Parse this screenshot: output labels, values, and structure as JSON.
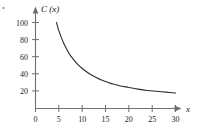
{
  "figure": {
    "corner_mark": "·",
    "background_color": "#ffffff",
    "axis_color": "#6f6f6f",
    "curve_color": "#2b2b2b",
    "label_color": "#222222"
  },
  "chart_data": {
    "type": "line",
    "title": "",
    "subtitle": "",
    "xlabel": "x",
    "ylabel": "C (x)",
    "ylabel_parts": {
      "function_name": "C",
      "variable": "x"
    },
    "xlim": [
      0,
      31
    ],
    "ylim": [
      0,
      108
    ],
    "xticks": [
      0,
      5,
      10,
      15,
      20,
      25,
      30
    ],
    "xtick_labels": [
      "0",
      "5",
      "10",
      "15",
      "20",
      "25",
      "30"
    ],
    "yticks": [
      20,
      40,
      60,
      80,
      100
    ],
    "ytick_labels": [
      "20",
      "40",
      "60",
      "80",
      "100"
    ],
    "grid": false,
    "legend": null,
    "legend_position": "none",
    "annotations": [],
    "axis_arrows": {
      "x_end": true,
      "y_end": true
    },
    "series": [
      {
        "name": "C (x)",
        "x": [
          4.5,
          4.8,
          5.0,
          5.5,
          6.0,
          6.5,
          7.0,
          7.5,
          8.0,
          9.0,
          10.0,
          11.0,
          12.0,
          13.0,
          14.0,
          15.0,
          16.0,
          17.0,
          18.0,
          20.0,
          22.0,
          24.0,
          26.0,
          28.0,
          30.0
        ],
        "y": [
          100.0,
          94.0,
          90.5,
          83.0,
          76.5,
          71.0,
          66.0,
          61.5,
          58.0,
          51.5,
          46.5,
          42.5,
          39.0,
          36.0,
          33.5,
          31.5,
          29.5,
          28.0,
          26.5,
          24.5,
          22.5,
          21.0,
          20.0,
          19.0,
          18.0
        ]
      }
    ]
  }
}
